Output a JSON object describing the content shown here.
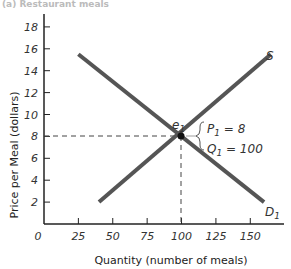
{
  "caption": "(a) Restaurant meals",
  "chart_data": {
    "type": "line",
    "title": "",
    "xlabel": "Quantity (number of meals)",
    "ylabel": "Price per Meal (dollars)",
    "xlim": [
      0,
      170
    ],
    "ylim": [
      0,
      19
    ],
    "x_ticks": [
      "0",
      "25",
      "50",
      "75",
      "100",
      "125",
      "150"
    ],
    "y_ticks": [
      "2",
      "4",
      "6",
      "8",
      "10",
      "12",
      "14",
      "16",
      "18"
    ],
    "grid": false,
    "series": [
      {
        "name": "S",
        "points": [
          [
            40,
            2
          ],
          [
            165,
            15.5
          ]
        ],
        "color": "#555555"
      },
      {
        "name": "D1",
        "points": [
          [
            25,
            15.5
          ],
          [
            160,
            2
          ]
        ],
        "color": "#555555"
      }
    ],
    "equilibrium": {
      "label": "e1",
      "x": 100,
      "y": 8
    },
    "annotations": [
      "P1 = 8",
      "Q1 = 100"
    ]
  },
  "labels": {
    "supply": "S",
    "demand": "D",
    "demand_sub": "1",
    "eq": "e",
    "eq_sub": "1",
    "p_line": "P",
    "p_sub": "1",
    "p_val": " = 8",
    "q_line": "Q",
    "q_sub": "1",
    "q_val": " = 100"
  }
}
